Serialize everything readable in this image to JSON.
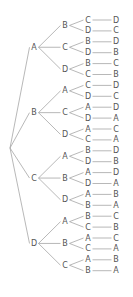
{
  "diagram": {
    "type": "tree",
    "title": "",
    "root": "",
    "colors": {
      "line": "#999999",
      "text": "#555555",
      "background": "#ffffff"
    },
    "branches": [
      {
        "label": "A",
        "children": [
          {
            "label": "B",
            "children": [
              {
                "label": "C",
                "leaf": "D"
              },
              {
                "label": "D",
                "leaf": "C"
              }
            ]
          },
          {
            "label": "C",
            "children": [
              {
                "label": "B",
                "leaf": "D"
              },
              {
                "label": "D",
                "leaf": "B"
              }
            ]
          },
          {
            "label": "D",
            "children": [
              {
                "label": "B",
                "leaf": "C"
              },
              {
                "label": "C",
                "leaf": "B"
              }
            ]
          }
        ]
      },
      {
        "label": "B",
        "children": [
          {
            "label": "A",
            "children": [
              {
                "label": "C",
                "leaf": "D"
              },
              {
                "label": "D",
                "leaf": "C"
              }
            ]
          },
          {
            "label": "C",
            "children": [
              {
                "label": "A",
                "leaf": "D"
              },
              {
                "label": "D",
                "leaf": "A"
              }
            ]
          },
          {
            "label": "D",
            "children": [
              {
                "label": "A",
                "leaf": "C"
              },
              {
                "label": "C",
                "leaf": "A"
              }
            ]
          }
        ]
      },
      {
        "label": "C",
        "children": [
          {
            "label": "A",
            "children": [
              {
                "label": "B",
                "leaf": "D"
              },
              {
                "label": "D",
                "leaf": "B"
              }
            ]
          },
          {
            "label": "B",
            "children": [
              {
                "label": "A",
                "leaf": "D"
              },
              {
                "label": "D",
                "leaf": "A"
              }
            ]
          },
          {
            "label": "D",
            "children": [
              {
                "label": "A",
                "leaf": "B"
              },
              {
                "label": "B",
                "leaf": "A"
              }
            ]
          }
        ]
      },
      {
        "label": "D",
        "children": [
          {
            "label": "A",
            "children": [
              {
                "label": "B",
                "leaf": "C"
              },
              {
                "label": "C",
                "leaf": "B"
              }
            ]
          },
          {
            "label": "B",
            "children": [
              {
                "label": "A",
                "leaf": "C"
              },
              {
                "label": "C",
                "leaf": "A"
              }
            ]
          },
          {
            "label": "C",
            "children": [
              {
                "label": "A",
                "leaf": "B"
              },
              {
                "label": "B",
                "leaf": "A"
              }
            ]
          }
        ]
      }
    ]
  }
}
